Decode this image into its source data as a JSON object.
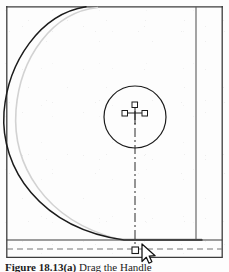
{
  "figure": {
    "caption_label": "Figure 18.13(a)",
    "caption_text": " Drag the Handle",
    "caption_full": "Figure 18.13(a) Drag the Handle"
  },
  "drawing": {
    "title": "cad-fillet-drag-view",
    "colors": {
      "object_line": "#1a1a1a",
      "preview_line": "#c9c9c9",
      "border_line": "#3a3a3a",
      "centerline": "#2b2b2b",
      "handle_stroke": "#1a1a1a",
      "handle_fill": "#ffffff",
      "cursor_fill": "#ffffff",
      "cursor_stroke": "#111111",
      "background": "#ffffff"
    },
    "viewport": {
      "left_border_x": 6,
      "top_border_y": 6,
      "right_border_x": 222,
      "inner_vertical_x": 196,
      "base_line_y": 240,
      "dashed_base_y": 249
    },
    "entities": [
      {
        "name": "fillet-arc-current",
        "type": "arc",
        "style": "solid",
        "stroke": "#1a1a1a",
        "description": "Large dark quarter-round fillet arc from top edge sweeping left and down to the base line"
      },
      {
        "name": "fillet-arc-preview",
        "type": "arc",
        "style": "solid",
        "stroke": "#c9c9c9",
        "description": "Light gray ghost/preview arc of the original radius, inset from the dark arc"
      },
      {
        "name": "circle-entity",
        "type": "circle",
        "center_x": 135,
        "center_y": 117,
        "radius": 31,
        "stroke": "#1a1a1a",
        "description": "Selected circle with center marker and grips"
      },
      {
        "name": "center-marker",
        "type": "cross",
        "x": 135,
        "y": 112,
        "description": "Small plus-shaped center mark of the circle"
      },
      {
        "name": "center-line",
        "type": "line",
        "style": "dash-dot",
        "from_x": 135,
        "from_y": 105,
        "to_x": 135,
        "to_y": 250,
        "description": "Vertical dash-dot construction centerline from circle center down to the dragged grip"
      },
      {
        "name": "base-line",
        "type": "line",
        "style": "solid",
        "y": 240,
        "description": "Horizontal solid base/tangent edge"
      },
      {
        "name": "base-dashed-line",
        "type": "line",
        "style": "dashed",
        "y": 249,
        "description": "Horizontal dashed reference line below the base edge"
      },
      {
        "name": "inner-vertical-line",
        "type": "line",
        "style": "solid",
        "x": 196,
        "description": "Vertical solid edge near the right side of the part"
      }
    ],
    "grips": [
      {
        "name": "grip-top",
        "x": 135,
        "y": 105,
        "state": "unselected"
      },
      {
        "name": "grip-left",
        "x": 126,
        "y": 113,
        "state": "unselected"
      },
      {
        "name": "grip-right",
        "x": 144,
        "y": 113,
        "state": "unselected"
      },
      {
        "name": "grip-dragged",
        "x": 135,
        "y": 250,
        "state": "dragging"
      }
    ],
    "cursor": {
      "name": "arrow-cursor",
      "x": 143,
      "y": 246,
      "type": "arrow"
    }
  }
}
